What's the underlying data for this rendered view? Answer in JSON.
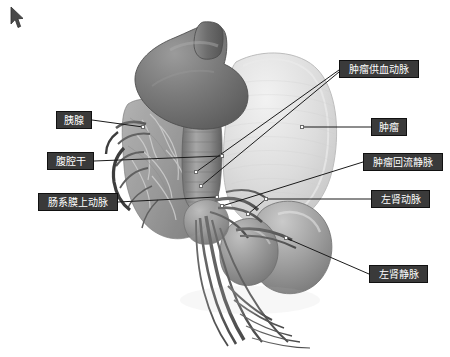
{
  "scene": {
    "background_color": "#ffffff",
    "kind": "3d-medical-reconstruction",
    "description_title": "腹部血管三维重建",
    "view": {
      "width": 450,
      "height": 357
    }
  },
  "cursor": {
    "name": "mouse-pointer",
    "x": 9,
    "y": 6
  },
  "model": {
    "palette": {
      "organ_dark": "#6e6e6e",
      "organ_mid": "#8a8a8a",
      "organ_light": "#bdbdbd",
      "tumor_pale": "#dcdcdc",
      "tumor_pale_edge": "#c9c9c9",
      "kidney": "#9a9a9a",
      "vessel_dark": "#5f5f5f",
      "vessel_mid": "#787878",
      "highlight": "#efefef",
      "outline": "#4a4a4a"
    },
    "parts": [
      {
        "id": "stomach-spleen",
        "label": "上腹脏器",
        "tone": "organ_dark"
      },
      {
        "id": "tumor-mass",
        "label": "肿瘤团块",
        "tone": "tumor_pale"
      },
      {
        "id": "pancreas-body",
        "label": "胰腺实质",
        "tone": "organ_mid"
      },
      {
        "id": "left-kidney",
        "label": "左肾",
        "tone": "kidney"
      },
      {
        "id": "vessel-tree",
        "label": "血管树",
        "tone": "vessel_dark"
      }
    ]
  },
  "annotations": {
    "style": {
      "box_fill": "#3a3a3a",
      "box_border": "#111111",
      "text_color": "#ffffff",
      "leader_color": "#1b1b1b",
      "leader_width": 1,
      "anchor_fill": "#ffffff",
      "anchor_border": "#6b6b6b"
    },
    "items": [
      {
        "id": "pancreas",
        "name": "label-pancreas",
        "text": "胰腺",
        "side": "left",
        "box": {
          "x": 56,
          "y": 111,
          "w": 36,
          "h": 18
        },
        "leaders": [
          {
            "from": {
              "x": 92,
              "y": 120
            },
            "to": {
              "x": 143,
              "y": 127
            }
          }
        ],
        "anchors": [
          {
            "x": 141,
            "y": 125
          }
        ]
      },
      {
        "id": "celiac-trunk",
        "name": "label-celiac-trunk",
        "text": "腹腔干",
        "side": "left",
        "box": {
          "x": 47,
          "y": 152,
          "w": 47,
          "h": 18
        },
        "leaders": [
          {
            "from": {
              "x": 94,
              "y": 161
            },
            "to": {
              "x": 222,
              "y": 156
            }
          }
        ],
        "anchors": [
          {
            "x": 220,
            "y": 154
          }
        ]
      },
      {
        "id": "superior-mesenteric-artery",
        "name": "label-superior-mesenteric-artery",
        "text": "肠系膜上动脉",
        "side": "left",
        "box": {
          "x": 38,
          "y": 193,
          "w": 80,
          "h": 18
        },
        "leaders": [
          {
            "from": {
              "x": 118,
              "y": 202
            },
            "to": {
              "x": 217,
              "y": 197
            }
          }
        ],
        "anchors": [
          {
            "x": 215,
            "y": 195
          }
        ]
      },
      {
        "id": "tumor-feeding-artery",
        "name": "label-tumor-feeding-artery",
        "text": "肿瘤供血动脉",
        "side": "right",
        "box": {
          "x": 339,
          "y": 60,
          "w": 80,
          "h": 18
        },
        "leaders": [
          {
            "from": {
              "x": 339,
              "y": 70
            },
            "to": {
              "x": 196,
              "y": 172
            }
          },
          {
            "from": {
              "x": 339,
              "y": 72
            },
            "to": {
              "x": 201,
              "y": 186
            }
          }
        ],
        "anchors": [
          {
            "x": 194,
            "y": 170
          },
          {
            "x": 199,
            "y": 184
          }
        ]
      },
      {
        "id": "tumor",
        "name": "label-tumor",
        "text": "肿瘤",
        "side": "right",
        "box": {
          "x": 371,
          "y": 118,
          "w": 36,
          "h": 18
        },
        "leaders": [
          {
            "from": {
              "x": 371,
              "y": 127
            },
            "to": {
              "x": 302,
              "y": 127
            }
          }
        ],
        "anchors": [
          {
            "x": 300,
            "y": 125
          }
        ]
      },
      {
        "id": "tumor-draining-vein",
        "name": "label-tumor-draining-vein",
        "text": "肿瘤回流静脉",
        "side": "right",
        "box": {
          "x": 363,
          "y": 153,
          "w": 80,
          "h": 18
        },
        "leaders": [
          {
            "from": {
              "x": 363,
              "y": 162
            },
            "to": {
              "x": 222,
              "y": 206
            }
          }
        ],
        "anchors": [
          {
            "x": 220,
            "y": 204
          }
        ]
      },
      {
        "id": "left-renal-artery",
        "name": "label-left-renal-artery",
        "text": "左肾动脉",
        "side": "right",
        "box": {
          "x": 371,
          "y": 190,
          "w": 59,
          "h": 18
        },
        "leaders": [
          {
            "from": {
              "x": 371,
              "y": 199
            },
            "to": {
              "x": 266,
              "y": 199
            }
          },
          {
            "from": {
              "x": 266,
              "y": 199
            },
            "to": {
              "x": 248,
              "y": 214
            }
          }
        ],
        "anchors": [
          {
            "x": 264,
            "y": 197
          },
          {
            "x": 246,
            "y": 212
          }
        ]
      },
      {
        "id": "left-renal-vein",
        "name": "label-left-renal-vein",
        "text": "左肾静脉",
        "side": "right",
        "box": {
          "x": 369,
          "y": 265,
          "w": 59,
          "h": 18
        },
        "leaders": [
          {
            "from": {
              "x": 369,
              "y": 274
            },
            "to": {
              "x": 286,
              "y": 238
            }
          }
        ],
        "anchors": [
          {
            "x": 284,
            "y": 236
          }
        ]
      }
    ]
  }
}
